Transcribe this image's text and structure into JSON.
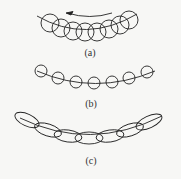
{
  "panels": [
    {
      "id": "a",
      "label": "(a)",
      "shape": "circle",
      "count": 8,
      "description": "overlapping circles along an arc with rotation arrow"
    },
    {
      "id": "b",
      "label": "(b)",
      "shape": "circle",
      "count": 8,
      "description": "separated small circles along an arc"
    },
    {
      "id": "c",
      "label": "(c)",
      "shape": "ellipse",
      "count": 8,
      "description": "overlapping elongated ellipses along an arc"
    }
  ],
  "arrow": {
    "direction": "left"
  },
  "colors": {
    "stroke": "#222222",
    "background": "#f7f7f5"
  }
}
